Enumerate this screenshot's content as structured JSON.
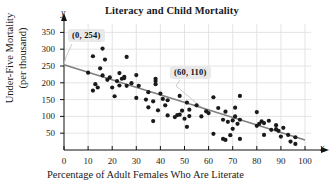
{
  "chart_data": {
    "type": "scatter",
    "title": "Literacy and Child Mortality",
    "xlabel": "Percentage of Adult Females Who Are Literate",
    "ylabel_line1": "Under-Five Mortality",
    "ylabel_line2": "(per thousand)",
    "x_var": "x",
    "y_var": "y",
    "xlim": [
      0,
      100
    ],
    "ylim": [
      0,
      375
    ],
    "xticks": [
      0,
      10,
      20,
      30,
      40,
      50,
      60,
      70,
      80,
      90,
      100
    ],
    "yticks": [
      50,
      100,
      150,
      200,
      250,
      300,
      350
    ],
    "grid": true,
    "legend": "none",
    "annotations": [
      {
        "label": "(0, 254)",
        "x": 0,
        "y": 254
      },
      {
        "label": "(60, 110)",
        "x": 60,
        "y": 110
      }
    ],
    "trendline": {
      "name": "least-squares regression line",
      "x": [
        0,
        100
      ],
      "y": [
        254,
        30
      ],
      "color": "#808080"
    },
    "series": [
      {
        "name": "Countries",
        "marker": "circle",
        "color": "#1a1a1a",
        "points": [
          [
            10,
            230
          ],
          [
            12,
            177
          ],
          [
            12,
            279
          ],
          [
            13,
            196
          ],
          [
            14,
            186
          ],
          [
            15,
            243
          ],
          [
            16,
            302
          ],
          [
            16,
            222
          ],
          [
            17,
            269
          ],
          [
            18,
            209
          ],
          [
            19,
            216
          ],
          [
            20,
            186
          ],
          [
            21,
            160
          ],
          [
            22,
            205
          ],
          [
            23,
            229
          ],
          [
            23,
            192
          ],
          [
            24,
            212
          ],
          [
            25,
            214
          ],
          [
            25,
            218
          ],
          [
            26,
            277
          ],
          [
            26,
            191
          ],
          [
            28,
            199
          ],
          [
            30,
            223
          ],
          [
            30,
            155
          ],
          [
            31,
            191
          ],
          [
            34,
            150
          ],
          [
            35,
            127
          ],
          [
            35,
            172
          ],
          [
            37,
            145
          ],
          [
            37,
            86
          ],
          [
            38,
            205
          ],
          [
            38,
            196
          ],
          [
            38,
            212
          ],
          [
            39,
            118
          ],
          [
            40,
            168
          ],
          [
            41,
            152
          ],
          [
            42,
            133
          ],
          [
            43,
            148
          ],
          [
            43,
            103
          ],
          [
            46,
            98
          ],
          [
            47,
            104
          ],
          [
            48,
            161
          ],
          [
            48,
            105
          ],
          [
            49,
            117
          ],
          [
            50,
            93
          ],
          [
            51,
            141
          ],
          [
            51,
            69
          ],
          [
            52,
            120
          ],
          [
            52,
            101
          ],
          [
            55,
            133
          ],
          [
            57,
            100
          ],
          [
            59,
            115
          ],
          [
            60,
            110
          ],
          [
            62,
            157
          ],
          [
            62,
            48
          ],
          [
            64,
            125
          ],
          [
            66,
            90
          ],
          [
            66,
            33
          ],
          [
            67,
            114
          ],
          [
            67,
            30
          ],
          [
            68,
            84
          ],
          [
            69,
            44
          ],
          [
            70,
            88
          ],
          [
            70,
            63
          ],
          [
            71,
            126
          ],
          [
            71,
            100
          ],
          [
            72,
            78
          ],
          [
            73,
            161
          ],
          [
            73,
            90
          ],
          [
            73,
            33
          ],
          [
            80,
            113
          ],
          [
            80,
            72
          ],
          [
            81,
            78
          ],
          [
            82,
            85
          ],
          [
            83,
            45
          ],
          [
            83,
            80
          ],
          [
            85,
            87
          ],
          [
            86,
            60
          ],
          [
            88,
            62
          ],
          [
            88,
            74
          ],
          [
            89,
            57
          ],
          [
            90,
            40
          ],
          [
            91,
            66
          ],
          [
            93,
            45
          ],
          [
            94,
            25
          ],
          [
            96,
            38
          ],
          [
            96,
            18
          ]
        ]
      }
    ]
  }
}
